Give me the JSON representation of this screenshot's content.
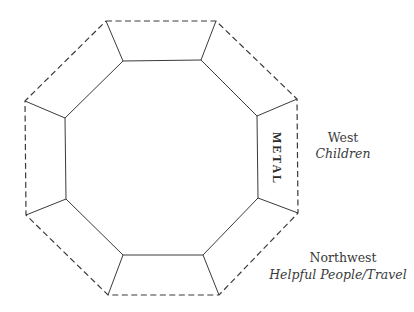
{
  "diagram": {
    "type": "bagua-octagon",
    "stroke_color": "#3a3a3a",
    "outer_octagon_style": "dashed",
    "inner_octagon_style": "solid",
    "highlighted_segment": {
      "label": "METAL",
      "position": "right"
    },
    "labels": [
      {
        "direction": "West",
        "area": "Children"
      },
      {
        "direction": "Northwest",
        "area": "Helpful People/Travel"
      }
    ]
  }
}
